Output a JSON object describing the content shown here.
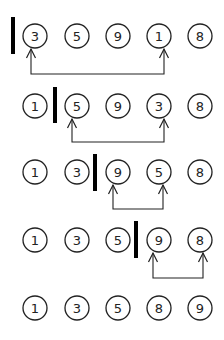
{
  "colors": {
    "stroke": "#222222",
    "divider": "#000000",
    "background": "#ffffff"
  },
  "layout": {
    "column_x": [
      35,
      77,
      118,
      159,
      200
    ],
    "node_radius": 12
  },
  "rows": [
    {
      "y": 36,
      "values": [
        "3",
        "5",
        "9",
        "1",
        "8"
      ],
      "divider": {
        "x": 13,
        "y1": 17,
        "y2": 54
      },
      "swap": {
        "from_col": 0,
        "to_col": 3,
        "from_x": 31,
        "to_x": 164,
        "line_y": 74
      }
    },
    {
      "y": 106,
      "values": [
        "1",
        "5",
        "9",
        "3",
        "8"
      ],
      "divider": {
        "x": 55,
        "y1": 87,
        "y2": 123
      },
      "swap": {
        "from_col": 1,
        "to_col": 3,
        "from_x": 72,
        "to_x": 164,
        "line_y": 142
      }
    },
    {
      "y": 172,
      "values": [
        "1",
        "3",
        "9",
        "5",
        "8"
      ],
      "divider": {
        "x": 95,
        "y1": 154,
        "y2": 191
      },
      "swap": {
        "from_col": 2,
        "to_col": 3,
        "from_x": 113,
        "to_x": 163,
        "line_y": 209
      }
    },
    {
      "y": 240,
      "values": [
        "1",
        "3",
        "5",
        "9",
        "8"
      ],
      "divider": {
        "x": 136,
        "y1": 221,
        "y2": 258
      },
      "swap": {
        "from_col": 3,
        "to_col": 4,
        "from_x": 153,
        "to_x": 203,
        "line_y": 278
      }
    },
    {
      "y": 308,
      "values": [
        "1",
        "3",
        "5",
        "8",
        "9"
      ],
      "divider": null,
      "swap": null
    }
  ]
}
